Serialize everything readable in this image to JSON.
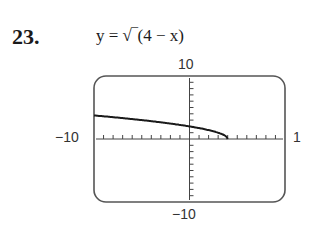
{
  "problem": {
    "number": "23.",
    "equation": "y = √‾(4 − x)"
  },
  "window": {
    "ymax_label": "10",
    "ymin_label": "−10",
    "xmin_label": "−10",
    "xmax_label": "1"
  },
  "chart_data": {
    "type": "line",
    "xlabel": "",
    "ylabel": "",
    "xlim": [
      -10,
      10
    ],
    "ylim": [
      -10,
      10
    ],
    "x_tick_step": 1,
    "y_tick_step": 1,
    "grid": false,
    "series": [
      {
        "name": "y = sqrt(4 - x)",
        "x": [
          -10,
          -8,
          -6,
          -4,
          -2,
          0,
          1,
          2,
          3,
          3.5,
          4
        ],
        "y": [
          3.74,
          3.46,
          3.16,
          2.83,
          2.45,
          2.0,
          1.73,
          1.41,
          1.0,
          0.71,
          0.0
        ]
      }
    ],
    "annotations": [
      "10",
      "-10",
      "-10",
      "1"
    ]
  },
  "colors": {
    "frame": "#555555",
    "curve": "#1a1a1a",
    "axis": "#444444"
  }
}
